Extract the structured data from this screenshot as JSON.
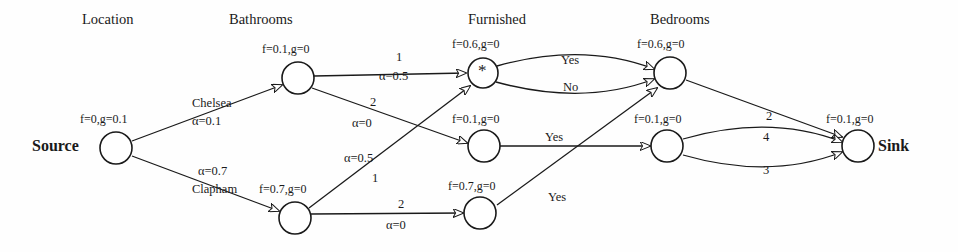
{
  "diagram": {
    "column_headers": [
      {
        "id": "location",
        "label": "Location",
        "x": 82,
        "y": 12
      },
      {
        "id": "bathrooms",
        "label": "Bathrooms",
        "x": 229,
        "y": 12
      },
      {
        "id": "furnished",
        "label": "Furnished",
        "x": 468,
        "y": 12
      },
      {
        "id": "bedrooms",
        "label": "Bedrooms",
        "x": 650,
        "y": 12
      }
    ],
    "terminals": [
      {
        "id": "source",
        "label": "Source",
        "x": 32,
        "y": 138
      },
      {
        "id": "sink",
        "label": "Sink",
        "x": 878,
        "y": 138
      }
    ],
    "nodes": [
      {
        "id": "source",
        "cx": 116,
        "cy": 148,
        "r": 16,
        "annotation": "f=0,g=0.1",
        "ann_x": 80,
        "ann_y": 113,
        "glyph": ""
      },
      {
        "id": "bath-top",
        "cx": 298,
        "cy": 78,
        "r": 16,
        "annotation": "f=0.1,g=0",
        "ann_x": 262,
        "ann_y": 43,
        "glyph": ""
      },
      {
        "id": "bath-bot",
        "cx": 295,
        "cy": 218,
        "r": 16,
        "annotation": "f=0.7,g=0",
        "ann_x": 259,
        "ann_y": 183,
        "glyph": ""
      },
      {
        "id": "furn-top",
        "cx": 483,
        "cy": 73,
        "r": 15,
        "annotation": "f=0.6,g=0",
        "ann_x": 452,
        "ann_y": 38,
        "glyph": "*"
      },
      {
        "id": "furn-mid",
        "cx": 484,
        "cy": 146,
        "r": 16,
        "annotation": "f=0.1,g=0",
        "ann_x": 452,
        "ann_y": 113,
        "glyph": ""
      },
      {
        "id": "furn-bot",
        "cx": 480,
        "cy": 213,
        "r": 16,
        "annotation": "f=0.7,g=0",
        "ann_x": 448,
        "ann_y": 180,
        "glyph": ""
      },
      {
        "id": "bed-top",
        "cx": 670,
        "cy": 73,
        "r": 16,
        "annotation": "f=0.6,g=0",
        "ann_x": 637,
        "ann_y": 38,
        "glyph": ""
      },
      {
        "id": "bed-bot",
        "cx": 667,
        "cy": 146,
        "r": 16,
        "annotation": "f=0.1,g=0",
        "ann_x": 634,
        "ann_y": 113,
        "glyph": ""
      },
      {
        "id": "sink",
        "cx": 858,
        "cy": 146,
        "r": 16,
        "annotation": "f=0.1,g=0",
        "ann_x": 826,
        "ann_y": 113,
        "glyph": ""
      }
    ],
    "edges": [
      {
        "id": "source-bath-top",
        "from": "source",
        "to": "bath-top",
        "kind": "line",
        "x1": 132,
        "y1": 141,
        "x2": 282,
        "y2": 85
      },
      {
        "id": "source-bath-bot",
        "from": "source",
        "to": "bath-bot",
        "kind": "line",
        "x1": 132,
        "y1": 156,
        "x2": 279,
        "y2": 211
      },
      {
        "id": "bath-top-furn-top",
        "from": "bath-top",
        "to": "furn-top",
        "kind": "line",
        "x1": 314,
        "y1": 76,
        "x2": 466,
        "y2": 73
      },
      {
        "id": "bath-top-furn-mid",
        "from": "bath-top",
        "to": "furn-mid",
        "kind": "line",
        "x1": 312,
        "y1": 88,
        "x2": 467,
        "y2": 143
      },
      {
        "id": "bath-bot-furn-top",
        "from": "bath-bot",
        "to": "furn-top",
        "kind": "line",
        "x1": 309,
        "y1": 208,
        "x2": 470,
        "y2": 86
      },
      {
        "id": "bath-bot-furn-bot",
        "from": "bath-bot",
        "to": "furn-bot",
        "kind": "line",
        "x1": 311,
        "y1": 214,
        "x2": 463,
        "y2": 213
      },
      {
        "id": "furn-top-bed-top-yes",
        "from": "furn-top",
        "to": "bed-top",
        "kind": "curve",
        "x1": 497,
        "y1": 66,
        "cx": 583,
        "cy": 42,
        "x2": 654,
        "y2": 69
      },
      {
        "id": "furn-top-bed-top-no",
        "from": "furn-top",
        "to": "bed-top",
        "kind": "curve",
        "x1": 496,
        "y1": 82,
        "cx": 584,
        "cy": 106,
        "x2": 654,
        "y2": 79
      },
      {
        "id": "furn-mid-bed-bot-yes",
        "from": "furn-mid",
        "to": "bed-bot",
        "kind": "line",
        "x1": 500,
        "y1": 146,
        "x2": 650,
        "y2": 146
      },
      {
        "id": "furn-bot-bed-top-yes",
        "from": "furn-bot",
        "to": "bed-top",
        "kind": "line",
        "x1": 497,
        "y1": 205,
        "x2": 657,
        "y2": 88
      },
      {
        "id": "bed-top-sink",
        "from": "bed-top",
        "to": "sink",
        "kind": "line",
        "x1": 686,
        "y1": 80,
        "x2": 842,
        "y2": 137
      },
      {
        "id": "bed-bot-sink-4",
        "from": "bed-bot",
        "to": "sink",
        "kind": "curve",
        "x1": 683,
        "y1": 139,
        "cx": 770,
        "cy": 114,
        "x2": 842,
        "y2": 142
      },
      {
        "id": "bed-bot-sink-3",
        "from": "bed-bot",
        "to": "sink",
        "kind": "curve",
        "x1": 683,
        "y1": 155,
        "cx": 770,
        "cy": 180,
        "x2": 842,
        "y2": 152
      }
    ],
    "edge_labels": [
      {
        "id": "chelsea",
        "text": "Chelsea",
        "x": 192,
        "y": 97,
        "style": "elab"
      },
      {
        "id": "alpha-chelsea",
        "text": "α=0.1",
        "x": 192,
        "y": 115,
        "style": "elab"
      },
      {
        "id": "alpha-clapham",
        "text": "α=0.7",
        "x": 198,
        "y": 165,
        "style": "elab"
      },
      {
        "id": "clapham",
        "text": "Clapham",
        "x": 192,
        "y": 183,
        "style": "elab"
      },
      {
        "id": "cap-bt-ft",
        "text": "1",
        "x": 396,
        "y": 51,
        "style": "elab"
      },
      {
        "id": "alpha-bt-ft",
        "text": "α=0.5",
        "x": 379,
        "y": 70,
        "style": "elab"
      },
      {
        "id": "cap-bt-fm",
        "text": "2",
        "x": 370,
        "y": 96,
        "style": "elab"
      },
      {
        "id": "alpha-bt-fm",
        "text": "α=0",
        "x": 352,
        "y": 117,
        "style": "elab"
      },
      {
        "id": "alpha-bb-ft",
        "text": "α=0.5",
        "x": 344,
        "y": 152,
        "style": "elab"
      },
      {
        "id": "cap-bb-ft",
        "text": "1",
        "x": 372,
        "y": 172,
        "style": "elab"
      },
      {
        "id": "cap-bb-fb",
        "text": "2",
        "x": 398,
        "y": 198,
        "style": "elab"
      },
      {
        "id": "alpha-bb-fb",
        "text": "α=0",
        "x": 386,
        "y": 219,
        "style": "elab"
      },
      {
        "id": "yes-top",
        "text": "Yes",
        "x": 561,
        "y": 54,
        "style": "elab"
      },
      {
        "id": "no-top",
        "text": "No",
        "x": 563,
        "y": 81,
        "style": "elab"
      },
      {
        "id": "yes-mid",
        "text": "Yes",
        "x": 545,
        "y": 131,
        "style": "elab"
      },
      {
        "id": "yes-bot",
        "text": "Yes",
        "x": 548,
        "y": 191,
        "style": "elab"
      },
      {
        "id": "cap-bed-sink",
        "text": "2",
        "x": 766,
        "y": 110,
        "style": "elab"
      },
      {
        "id": "cap-sink-4",
        "text": "4",
        "x": 763,
        "y": 131,
        "style": "elab"
      },
      {
        "id": "cap-sink-3",
        "text": "3",
        "x": 763,
        "y": 164,
        "style": "elab"
      }
    ]
  },
  "colors": {
    "ink": "#1a1a1a",
    "paper": "#fefefe"
  }
}
